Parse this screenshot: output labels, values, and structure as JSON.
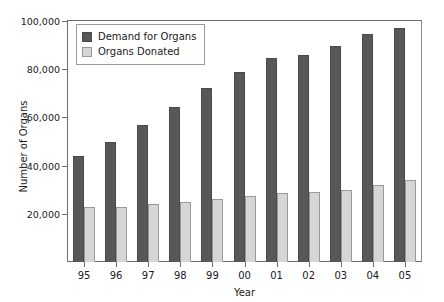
{
  "chart_data": {
    "type": "bar",
    "title": "",
    "xlabel": "Year",
    "ylabel": "Number of Organs",
    "categories": [
      "95",
      "96",
      "97",
      "98",
      "99",
      "00",
      "01",
      "02",
      "03",
      "04",
      "05"
    ],
    "series": [
      {
        "name": "Demand for Organs",
        "color": "#585858",
        "values": [
          44000,
          50000,
          57000,
          64500,
          72000,
          79000,
          84500,
          86000,
          89500,
          94500,
          97000
        ]
      },
      {
        "name": "Organs Donated",
        "color": "#d6d6d6",
        "values": [
          23000,
          23000,
          24000,
          25000,
          26000,
          27500,
          28500,
          29000,
          30000,
          32000,
          34000
        ]
      }
    ],
    "ylim": [
      0,
      100000
    ],
    "ytick_values": [
      20000,
      40000,
      60000,
      80000,
      100000
    ],
    "ytick_labels": [
      "20,000",
      "40,000",
      "60,000",
      "80,000",
      "100,000"
    ],
    "grid": false,
    "legend_position": "top-left"
  },
  "legend": {
    "items": [
      {
        "label": "Demand for Organs",
        "swatch": "demand"
      },
      {
        "label": "Organs Donated",
        "swatch": "donated"
      }
    ]
  },
  "axes": {
    "y_title": "Number of Organs",
    "x_title": "Year"
  }
}
